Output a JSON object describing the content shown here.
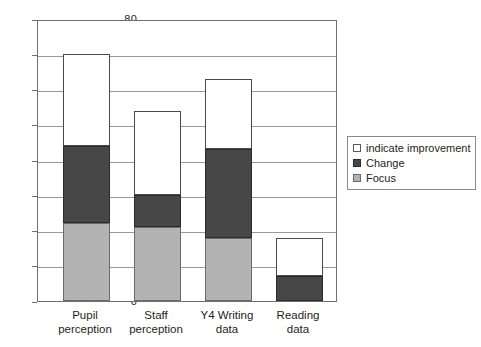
{
  "chart_data": {
    "type": "bar",
    "subtype": "stacked-bar",
    "title": "",
    "xlabel": "",
    "ylabel": "",
    "ylim": [
      0,
      80
    ],
    "ytick_step": 10,
    "yticks": [
      "80",
      "70",
      "60",
      "50",
      "40",
      "30",
      "20",
      "10",
      "0"
    ],
    "grid": true,
    "legend_position": "right",
    "categories": [
      "Pupil perception",
      "Staff perception",
      "Y4 Writing data",
      "Reading data"
    ],
    "category_lines": [
      [
        "Pupil",
        "perception"
      ],
      [
        "Staff",
        "perception"
      ],
      [
        "Y4 Writing",
        "data"
      ],
      [
        "Reading",
        "data"
      ]
    ],
    "series": [
      {
        "name": "Focus",
        "color": "#b3b3b3",
        "values": [
          22,
          21,
          18,
          0
        ]
      },
      {
        "name": "Change",
        "color": "#474747",
        "values": [
          22,
          9,
          25,
          7
        ]
      },
      {
        "name": "indicate improvement",
        "color": "#ffffff",
        "values": [
          26,
          24,
          20,
          11
        ]
      }
    ],
    "cumulative_tops": [
      [
        22,
        44,
        70
      ],
      [
        21,
        30,
        54
      ],
      [
        18,
        43,
        63
      ],
      [
        0,
        7,
        18
      ]
    ],
    "totals": [
      70,
      54,
      63,
      18
    ]
  },
  "legend": {
    "items": [
      {
        "label": "indicate improvement",
        "swatch": "improve"
      },
      {
        "label": "Change",
        "swatch": "change"
      },
      {
        "label": "Focus",
        "swatch": "focus"
      }
    ]
  }
}
